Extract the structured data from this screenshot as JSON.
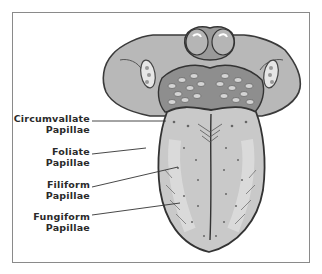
{
  "diagram": {
    "labels": [
      {
        "line1": "Circumvallate",
        "line2": "Papillae"
      },
      {
        "line1": "Foliate",
        "line2": "Papillae"
      },
      {
        "line1": "Filiform",
        "line2": "Papillae"
      },
      {
        "line1": "Fungiform",
        "line2": "Papillae"
      }
    ],
    "colors": {
      "frame": "#8a8a8a",
      "outline": "#3a3a3a",
      "tongue_fill": "#c9c9c9",
      "tongue_light": "#dedede",
      "text": "#2a2a2a"
    }
  }
}
